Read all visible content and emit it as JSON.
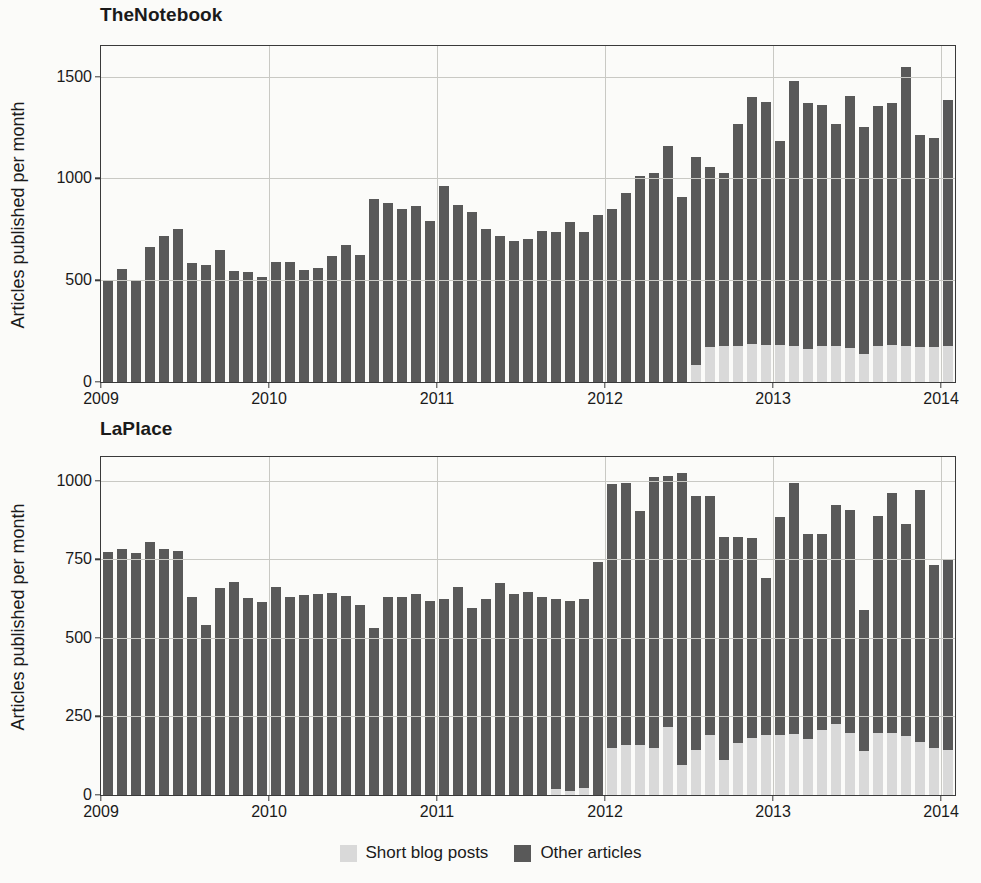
{
  "legend": {
    "position": "bottom-center",
    "items": [
      {
        "label": "Short blog posts",
        "color": "#d9d9d9",
        "key": "short"
      },
      {
        "label": "Other articles",
        "color": "#595959",
        "key": "other"
      }
    ]
  },
  "chart_data": [
    {
      "id": "thenotebook",
      "type": "bar",
      "stacked": true,
      "title": "TheNotebook",
      "xlabel": "",
      "ylabel": "Articles published per month",
      "ylim": [
        0,
        1650
      ],
      "yticks": [
        0,
        500,
        1000,
        1500
      ],
      "ytick_labels": [
        "0",
        "500",
        "1000",
        "1500"
      ],
      "xlim": [
        2009.0,
        2014.083
      ],
      "xticks": [
        2009,
        2010,
        2011,
        2012,
        2013,
        2014
      ],
      "xtick_labels": [
        "2009",
        "2010",
        "2011",
        "2012",
        "2013",
        "2014"
      ],
      "grid": true,
      "legend_keys": [
        "short",
        "other"
      ],
      "x": [
        "2009-01",
        "2009-02",
        "2009-03",
        "2009-04",
        "2009-05",
        "2009-06",
        "2009-07",
        "2009-08",
        "2009-09",
        "2009-10",
        "2009-11",
        "2009-12",
        "2010-01",
        "2010-02",
        "2010-03",
        "2010-04",
        "2010-05",
        "2010-06",
        "2010-07",
        "2010-08",
        "2010-09",
        "2010-10",
        "2010-11",
        "2010-12",
        "2011-01",
        "2011-02",
        "2011-03",
        "2011-04",
        "2011-05",
        "2011-06",
        "2011-07",
        "2011-08",
        "2011-09",
        "2011-10",
        "2011-11",
        "2011-12",
        "2012-01",
        "2012-02",
        "2012-03",
        "2012-04",
        "2012-05",
        "2012-06",
        "2012-07",
        "2012-08",
        "2012-09",
        "2012-10",
        "2012-11",
        "2012-12",
        "2013-01",
        "2013-02",
        "2013-03",
        "2013-04",
        "2013-05",
        "2013-06",
        "2013-07",
        "2013-08",
        "2013-09",
        "2013-10",
        "2013-11",
        "2013-12",
        "2014-01"
      ],
      "series": [
        {
          "name": "Short blog posts",
          "key": "short",
          "color": "#d9d9d9",
          "values": [
            0,
            0,
            0,
            0,
            0,
            0,
            0,
            0,
            0,
            0,
            0,
            0,
            0,
            0,
            0,
            0,
            0,
            0,
            0,
            0,
            0,
            0,
            0,
            0,
            0,
            0,
            0,
            0,
            0,
            0,
            0,
            0,
            0,
            0,
            0,
            0,
            0,
            0,
            0,
            0,
            0,
            0,
            85,
            170,
            175,
            178,
            185,
            180,
            182,
            178,
            160,
            175,
            178,
            168,
            140,
            178,
            182,
            178,
            172,
            172,
            178
          ]
        },
        {
          "name": "Other articles",
          "key": "other",
          "color": "#595959",
          "values": [
            502,
            553,
            497,
            664,
            718,
            751,
            586,
            576,
            650,
            544,
            540,
            518,
            591,
            587,
            552,
            558,
            621,
            672,
            624,
            898,
            878,
            848,
            862,
            791,
            962,
            867,
            834,
            752,
            717,
            693,
            700,
            740,
            736,
            787,
            737,
            820,
            848,
            929,
            1012,
            1027,
            1157,
            910,
            1020,
            884,
            853,
            1090,
            1215,
            1197,
            1004,
            1299,
            1210,
            1183,
            1087,
            1238,
            1112,
            1179,
            1190,
            1370,
            1041,
            1028,
            1207
          ]
        }
      ],
      "totals": [
        502,
        553,
        497,
        664,
        718,
        751,
        586,
        576,
        650,
        544,
        540,
        518,
        591,
        587,
        552,
        558,
        621,
        672,
        624,
        898,
        878,
        848,
        862,
        791,
        962,
        867,
        834,
        752,
        717,
        693,
        700,
        740,
        736,
        787,
        737,
        820,
        848,
        929,
        1012,
        1027,
        1157,
        910,
        1105,
        1054,
        1028,
        1268,
        1400,
        1377,
        1186,
        1477,
        1370,
        1358,
        1265,
        1406,
        1252,
        1357,
        1372,
        1548,
        1213,
        1200,
        1385
      ]
    },
    {
      "id": "laplace",
      "type": "bar",
      "stacked": true,
      "title": "LaPlace",
      "xlabel": "",
      "ylabel": "Articles published per month",
      "ylim": [
        0,
        1075
      ],
      "yticks": [
        0,
        250,
        500,
        750,
        1000
      ],
      "ytick_labels": [
        "0",
        "250",
        "500",
        "750",
        "1000"
      ],
      "xlim": [
        2009.0,
        2014.083
      ],
      "xticks": [
        2009,
        2010,
        2011,
        2012,
        2013,
        2014
      ],
      "xtick_labels": [
        "2009",
        "2010",
        "2011",
        "2012",
        "2013",
        "2014"
      ],
      "grid": true,
      "legend_keys": [
        "short",
        "other"
      ],
      "x": [
        "2009-01",
        "2009-02",
        "2009-03",
        "2009-04",
        "2009-05",
        "2009-06",
        "2009-07",
        "2009-08",
        "2009-09",
        "2009-10",
        "2009-11",
        "2009-12",
        "2010-01",
        "2010-02",
        "2010-03",
        "2010-04",
        "2010-05",
        "2010-06",
        "2010-07",
        "2010-08",
        "2010-09",
        "2010-10",
        "2010-11",
        "2010-12",
        "2011-01",
        "2011-02",
        "2011-03",
        "2011-04",
        "2011-05",
        "2011-06",
        "2011-07",
        "2011-08",
        "2011-09",
        "2011-10",
        "2011-11",
        "2011-12",
        "2012-01",
        "2012-02",
        "2012-03",
        "2012-04",
        "2012-05",
        "2012-06",
        "2012-07",
        "2012-08",
        "2012-09",
        "2012-10",
        "2012-11",
        "2012-12",
        "2013-01",
        "2013-02",
        "2013-03",
        "2013-04",
        "2013-05",
        "2013-06",
        "2013-07",
        "2013-08",
        "2013-09",
        "2013-10",
        "2013-11",
        "2013-12",
        "2014-01"
      ],
      "series": [
        {
          "name": "Short blog posts",
          "key": "short",
          "color": "#d9d9d9",
          "values": [
            0,
            0,
            0,
            0,
            0,
            0,
            0,
            0,
            0,
            0,
            0,
            0,
            0,
            0,
            0,
            0,
            0,
            0,
            0,
            0,
            0,
            0,
            0,
            0,
            0,
            0,
            0,
            0,
            0,
            0,
            0,
            0,
            18,
            14,
            22,
            0,
            150,
            158,
            160,
            150,
            215,
            95,
            142,
            190,
            110,
            167,
            180,
            190,
            190,
            195,
            178,
            208,
            225,
            198,
            140,
            198,
            196,
            188,
            168,
            148,
            142
          ]
        },
        {
          "name": "Other articles",
          "key": "other",
          "color": "#595959",
          "values": [
            772,
            782,
            770,
            805,
            782,
            775,
            631,
            540,
            658,
            676,
            628,
            615,
            662,
            630,
            635,
            640,
            642,
            633,
            605,
            532,
            630,
            630,
            640,
            618,
            625,
            660,
            595,
            622,
            673,
            640,
            647,
            630,
            607,
            603,
            600,
            742,
            840,
            835,
            742,
            861,
            800,
            930,
            808,
            762,
            710,
            653,
            637,
            500,
            694,
            797,
            651,
            623,
            696,
            710,
            448,
            691,
            763,
            673,
            802,
            584,
            610
          ]
        }
      ],
      "totals": [
        772,
        782,
        770,
        805,
        782,
        775,
        631,
        540,
        658,
        676,
        628,
        615,
        662,
        630,
        635,
        640,
        642,
        633,
        605,
        532,
        630,
        630,
        640,
        618,
        625,
        660,
        595,
        622,
        673,
        640,
        647,
        630,
        625,
        617,
        622,
        742,
        990,
        993,
        902,
        1011,
        1015,
        1025,
        950,
        952,
        820,
        820,
        817,
        690,
        884,
        992,
        829,
        831,
        921,
        908,
        588,
        889,
        959,
        861,
        970,
        732,
        752
      ]
    }
  ]
}
